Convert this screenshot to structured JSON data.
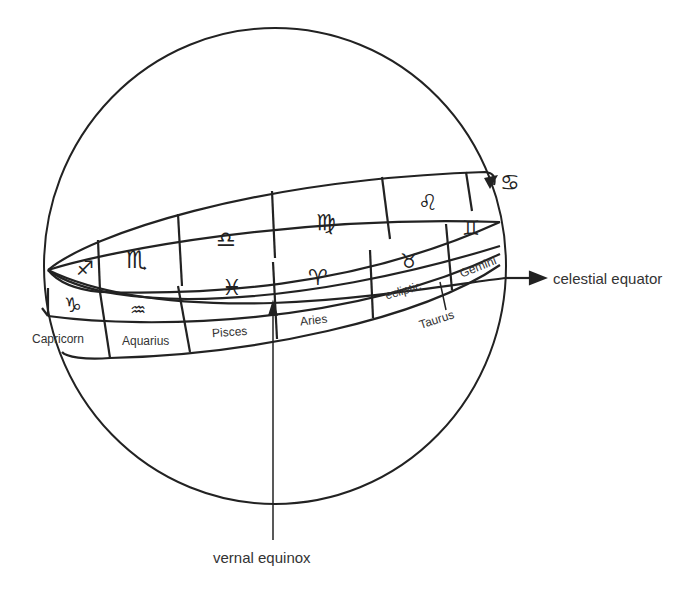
{
  "diagram": {
    "labels": {
      "celestial_equator": "celestial equator",
      "vernal_equinox": "vernal equinox",
      "ecliptic": "ecliptic"
    },
    "upper_band_symbols": [
      "♐",
      "♏",
      "♎",
      "♍",
      "♌",
      "♋"
    ],
    "lower_band_symbols": [
      "♑",
      "♒",
      "♓",
      "♈",
      "♉",
      "♊"
    ],
    "lower_band_names": [
      "Capricorn",
      "Aquarius",
      "Pisces",
      "Aries",
      "Taurus",
      "Gemini"
    ],
    "colors": {
      "line": "#222222",
      "text": "#333333",
      "background": "#ffffff"
    }
  }
}
